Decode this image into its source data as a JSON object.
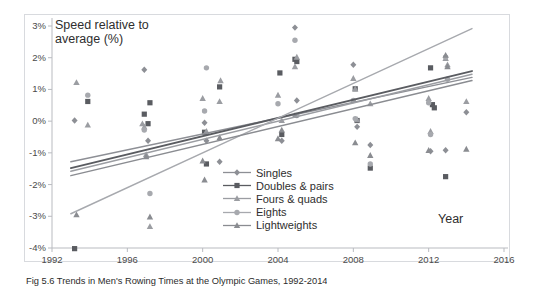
{
  "caption": "Fig 5.6 Trends in Men's Rowing Times at the Olympic Games, 1992-2014",
  "axes": {
    "y_title": "Speed relative to\naverage (%)",
    "x_title": "Year",
    "y_ticks": [
      "3%",
      "2%",
      "1%",
      "0%",
      "-1%",
      "-2%",
      "-3%",
      "-4%"
    ],
    "x_ticks": [
      "1992",
      "1996",
      "2000",
      "2004",
      "2008",
      "2012",
      "2016"
    ]
  },
  "legend": {
    "items": [
      {
        "label": "Singles",
        "marker": "diamond-marker",
        "color": "#8d8f95"
      },
      {
        "label": "Doubles & pairs",
        "marker": "square-marker",
        "color": "#5a5c61"
      },
      {
        "label": "Fours & quads",
        "marker": "triangle-marker",
        "color": "#9b9da2"
      },
      {
        "label": "Eights",
        "marker": "circle-marker",
        "color": "#a7a9ae"
      },
      {
        "label": "Lightweights",
        "marker": "triangle-marker",
        "color": "#8a8c91"
      }
    ]
  },
  "chart_data": {
    "type": "scatter",
    "title": "",
    "xlabel": "Year",
    "ylabel": "Speed relative to average (%)",
    "xlim": [
      1992,
      2016
    ],
    "ylim": [
      -4,
      3
    ],
    "xticks": [
      1992,
      1996,
      2000,
      2004,
      2008,
      2012,
      2016
    ],
    "yticks": [
      -4,
      -3,
      -2,
      -1,
      0,
      1,
      2,
      3
    ],
    "grid": false,
    "legend_position": "inside-center-bottom",
    "series": [
      {
        "name": "Singles",
        "marker": "diamond",
        "color": "#8d8f95",
        "points": [
          [
            1993.2,
            0.02
          ],
          [
            1996.9,
            1.62
          ],
          [
            1997.1,
            -0.62
          ],
          [
            2000.1,
            -0.05
          ],
          [
            2000.2,
            -0.62
          ],
          [
            2000.9,
            -1.28
          ],
          [
            2004.2,
            -0.62
          ],
          [
            2004.9,
            2.95
          ],
          [
            2005.0,
            0.65
          ],
          [
            2008.0,
            1.78
          ],
          [
            2008.2,
            -0.18
          ],
          [
            2008.9,
            -0.75
          ],
          [
            2012.1,
            -0.95
          ],
          [
            2012.9,
            -0.92
          ],
          [
            2014.0,
            0.28
          ]
        ],
        "trend": {
          "x0": 1993,
          "y0": -1.28,
          "x1": 2014.3,
          "y1": 1.38
        }
      },
      {
        "name": "Doubles & pairs",
        "marker": "square",
        "color": "#5a5c61",
        "points": [
          [
            1993.2,
            -4.02
          ],
          [
            1993.9,
            0.62
          ],
          [
            1996.9,
            0.22
          ],
          [
            1997.1,
            -0.08
          ],
          [
            1997.2,
            0.58
          ],
          [
            2000.1,
            -0.35
          ],
          [
            2000.2,
            -1.35
          ],
          [
            2000.9,
            1.08
          ],
          [
            2004.1,
            1.52
          ],
          [
            2004.2,
            -0.42
          ],
          [
            2004.9,
            1.95
          ],
          [
            2005.0,
            1.88
          ],
          [
            2008.1,
            1.02
          ],
          [
            2008.2,
            0.02
          ],
          [
            2008.9,
            -1.48
          ],
          [
            2012.1,
            1.68
          ],
          [
            2012.2,
            0.52
          ],
          [
            2012.3,
            0.42
          ],
          [
            2012.9,
            -1.75
          ]
        ],
        "trend": {
          "x0": 1993,
          "y0": -1.48,
          "x1": 2014.3,
          "y1": 1.58
        }
      },
      {
        "name": "Fours & quads",
        "marker": "triangle",
        "color": "#9b9da2",
        "points": [
          [
            1993.3,
            1.22
          ],
          [
            1993.9,
            -0.12
          ],
          [
            1996.8,
            -0.08
          ],
          [
            1996.9,
            -0.18
          ],
          [
            1997.0,
            -1.05
          ],
          [
            1997.2,
            -3.32
          ],
          [
            2000.0,
            0.72
          ],
          [
            2000.2,
            -0.32
          ],
          [
            2000.9,
            0.62
          ],
          [
            2000.95,
            1.28
          ],
          [
            2004.0,
            0.82
          ],
          [
            2004.2,
            0.02
          ],
          [
            2004.9,
            1.72
          ],
          [
            2005.0,
            2.02
          ],
          [
            2008.0,
            1.35
          ],
          [
            2008.1,
            1.02
          ],
          [
            2008.2,
            0.05
          ],
          [
            2008.9,
            0.55
          ],
          [
            2012.0,
            0.72
          ],
          [
            2012.1,
            -0.32
          ],
          [
            2012.9,
            1.98
          ],
          [
            2013.0,
            1.78
          ],
          [
            2014.0,
            0.62
          ]
        ],
        "trend": {
          "x0": 1993,
          "y0": -1.58,
          "x1": 2014.3,
          "y1": 1.48
        }
      },
      {
        "name": "Eights",
        "marker": "circle",
        "color": "#a7a9ae",
        "points": [
          [
            1993.9,
            0.82
          ],
          [
            1996.9,
            -0.28
          ],
          [
            1997.2,
            -2.28
          ],
          [
            2000.1,
            0.32
          ],
          [
            2000.2,
            1.68
          ],
          [
            2004.0,
            0.55
          ],
          [
            2004.9,
            2.55
          ],
          [
            2005.0,
            0.18
          ],
          [
            2008.0,
            0.65
          ],
          [
            2008.1,
            0.08
          ],
          [
            2008.9,
            -1.35
          ],
          [
            2012.0,
            0.58
          ],
          [
            2012.1,
            -0.42
          ],
          [
            2012.9,
            2.02
          ],
          [
            2013.0,
            1.32
          ]
        ],
        "trend": {
          "x0": 1993,
          "y0": -2.92,
          "x1": 2014.3,
          "y1": 2.92
        }
      },
      {
        "name": "Lightweights",
        "marker": "triangle",
        "color": "#8a8c91",
        "points": [
          [
            1993.3,
            -2.95
          ],
          [
            1997.0,
            -1.12
          ],
          [
            1997.2,
            -3.02
          ],
          [
            2000.0,
            -1.25
          ],
          [
            2000.1,
            -1.85
          ],
          [
            2000.9,
            -0.52
          ],
          [
            2004.0,
            -0.55
          ],
          [
            2004.2,
            -0.28
          ],
          [
            2004.9,
            0.18
          ],
          [
            2008.1,
            -0.68
          ],
          [
            2008.9,
            -1.08
          ],
          [
            2012.0,
            -0.92
          ],
          [
            2012.9,
            2.08
          ],
          [
            2013.0,
            1.72
          ],
          [
            2014.0,
            -0.88
          ]
        ],
        "trend": {
          "x0": 1993,
          "y0": -1.72,
          "x1": 2014.3,
          "y1": 1.28
        }
      }
    ]
  }
}
